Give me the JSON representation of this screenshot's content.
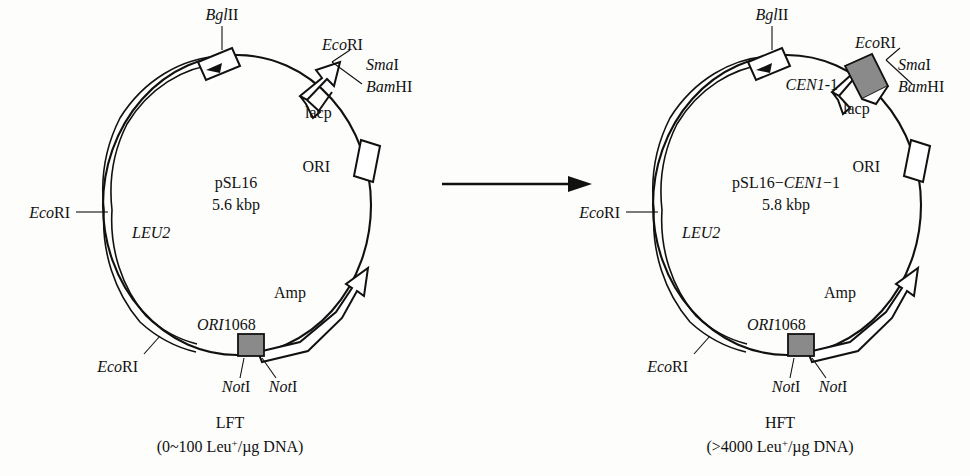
{
  "figure": {
    "type": "plasmid-map-comparison",
    "background_color": "#fdfdfc",
    "line_color": "#111111",
    "shaded_feature_color": "#8a8a8a"
  },
  "reaction_arrow": {
    "name": "transformation-arrow",
    "label": ""
  },
  "plasmids": [
    {
      "id": "left",
      "center_name": "pSL16",
      "center_size": "5.6 kbp",
      "caption_title": "LFT",
      "caption_detail": "(0~100 Leu+/µg DNA)",
      "features": [
        {
          "key": "leu2",
          "label": "LEU2",
          "style": "italic",
          "shape": "double-arc-arrow"
        },
        {
          "key": "lacp",
          "label": "lacp",
          "style": "roman",
          "shape": "open-arrow"
        },
        {
          "key": "ori",
          "label": "ORI",
          "style": "roman",
          "shape": "open-box"
        },
        {
          "key": "amp",
          "label": "Amp",
          "style": "roman",
          "shape": "open-arrow"
        },
        {
          "key": "ori1068",
          "label": "ORI1068",
          "style": "italic-prefix",
          "shape": "shaded-box"
        }
      ],
      "sites": [
        {
          "key": "bglii",
          "label": "BglII",
          "italic_part": "Bgl",
          "roman_part": "II"
        },
        {
          "key": "ecori",
          "label": "EcoRI",
          "italic_part": "Eco",
          "roman_part": "RI"
        },
        {
          "key": "smai",
          "label": "SmaI",
          "italic_part": "Sma",
          "roman_part": "I"
        },
        {
          "key": "bamhi",
          "label": "BamHI",
          "italic_part": "Bam",
          "roman_part": "HI"
        },
        {
          "key": "ecori-left",
          "label": "EcoRI",
          "italic_part": "Eco",
          "roman_part": "RI"
        },
        {
          "key": "ecori-bottom",
          "label": "EcoRI",
          "italic_part": "Eco",
          "roman_part": "RI"
        },
        {
          "key": "noti-1",
          "label": "NotI",
          "italic_part": "Not",
          "roman_part": "I"
        },
        {
          "key": "noti-2",
          "label": "NotI",
          "italic_part": "Not",
          "roman_part": "I"
        }
      ]
    },
    {
      "id": "right",
      "center_name": "pSL16−CEN1−1",
      "center_name_plain": "pSL16−",
      "center_name_italic": "CEN1",
      "center_name_suffix": "−1",
      "center_size": "5.8 kbp",
      "caption_title": "HFT",
      "caption_detail": "(>4000 Leu+/µg DNA)",
      "insert": {
        "key": "cen1-1",
        "label": "CEN1-1",
        "italic_part": "CEN1",
        "roman_part": "-1",
        "shape": "shaded-band"
      },
      "features": [
        {
          "key": "leu2",
          "label": "LEU2",
          "style": "italic",
          "shape": "double-arc-arrow"
        },
        {
          "key": "lacp",
          "label": "lacp",
          "style": "roman",
          "shape": "open-arrow"
        },
        {
          "key": "ori",
          "label": "ORI",
          "style": "roman",
          "shape": "open-box"
        },
        {
          "key": "amp",
          "label": "Amp",
          "style": "roman",
          "shape": "open-arrow"
        },
        {
          "key": "ori1068",
          "label": "ORI1068",
          "style": "italic-prefix",
          "shape": "shaded-box"
        }
      ],
      "sites": [
        {
          "key": "bglii",
          "label": "BglII",
          "italic_part": "Bgl",
          "roman_part": "II"
        },
        {
          "key": "ecori",
          "label": "EcoRI",
          "italic_part": "Eco",
          "roman_part": "RI"
        },
        {
          "key": "smai",
          "label": "SmaI",
          "italic_part": "Sma",
          "roman_part": "I"
        },
        {
          "key": "bamhi",
          "label": "BamHI",
          "italic_part": "Bam",
          "roman_part": "HI"
        },
        {
          "key": "ecori-left",
          "label": "EcoRI",
          "italic_part": "Eco",
          "roman_part": "RI"
        },
        {
          "key": "ecori-bottom",
          "label": "EcoRI",
          "italic_part": "Eco",
          "roman_part": "RI"
        },
        {
          "key": "noti-1",
          "label": "NotI",
          "italic_part": "Not",
          "roman_part": "I"
        },
        {
          "key": "noti-2",
          "label": "NotI",
          "italic_part": "Not",
          "roman_part": "I"
        }
      ]
    }
  ]
}
